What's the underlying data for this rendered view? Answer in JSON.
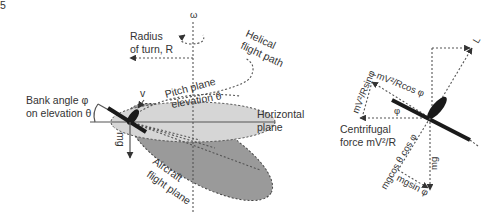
{
  "figure_number": "5",
  "left_diagram": {
    "axis_label": "ω",
    "radius_label_line1": "Radius",
    "radius_label_line2": "of turn, R",
    "helical_line1": "Helical",
    "helical_line2": "flight path",
    "pitch_line1": "Pitch plane",
    "pitch_line2": "elevation θ",
    "bank_line1": "Bank angle φ",
    "bank_line2": "on elevation θ",
    "velocity_label": "v",
    "horizontal_line1": "Horizontal",
    "horizontal_line2": "plane",
    "weight_label": "mg",
    "aircraft_plane_line1": "Aircraft",
    "aircraft_plane_line2": "flight plane"
  },
  "right_diagram": {
    "lift_label": "L",
    "sin_component": "mV²/Rsinφ",
    "cos_component": "mV²/Rcos φ",
    "phi_label": "φ",
    "centrifugal_line1": "Centrifugal",
    "centrifugal_line2": "force mV²/R",
    "mgcos_label": "mgcos θ cos φ",
    "mgsin_label": "mgsin φ",
    "weight_label": "mg"
  },
  "colors": {
    "horizontal_plane": "#d4d4d4",
    "flight_plane": "#9a9a9a",
    "aircraft": "#1a1a1a"
  }
}
